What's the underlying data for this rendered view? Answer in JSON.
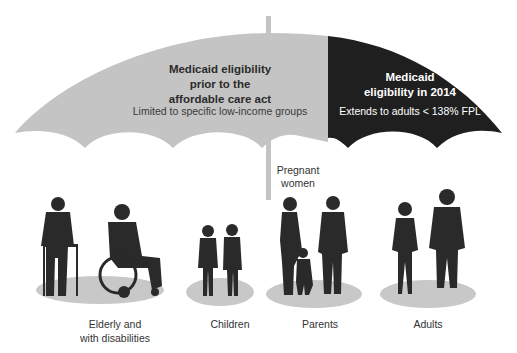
{
  "umbrella": {
    "left_section": {
      "title_lines": [
        "Medicaid eligibility",
        "prior to the",
        "affordable care act"
      ],
      "subtitle": "Limited to specific low-income groups",
      "color": "#c4c4c4"
    },
    "right_section": {
      "title_lines": [
        "Medicaid",
        "eligibility in 2014"
      ],
      "subtitle": "Extends to adults < 138% FPL",
      "color": "#1f1f1f"
    }
  },
  "annotation": {
    "lines": [
      "Pregnant",
      "women"
    ]
  },
  "groups": [
    {
      "id": "elderly",
      "label_lines": [
        "Elderly and",
        "with disabilities"
      ]
    },
    {
      "id": "children",
      "label_lines": [
        "Children"
      ]
    },
    {
      "id": "parents",
      "label_lines": [
        "Parents"
      ]
    },
    {
      "id": "adults",
      "label_lines": [
        "Adults"
      ]
    }
  ],
  "colors": {
    "ground_ellipse": "#c8c8c8",
    "silhouette": "#2a2a2a",
    "pole": "#c4c4c4"
  }
}
